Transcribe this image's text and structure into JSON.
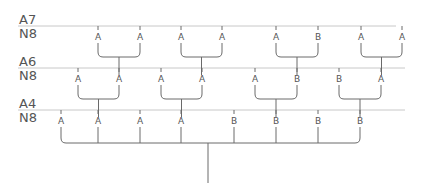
{
  "diagram": {
    "levels": [
      {
        "top_label": "A7",
        "bottom_label": "N8",
        "line_y": 26,
        "line_x1": 18,
        "line_x2": 396
      },
      {
        "top_label": "A6",
        "bottom_label": "N8",
        "line_y": 68,
        "line_x1": 18,
        "line_x2": 405
      },
      {
        "top_label": "A4",
        "bottom_label": "N8",
        "line_y": 110,
        "line_x1": 18,
        "line_x2": 405
      }
    ],
    "rows": [
      {
        "label_y": 37,
        "nodes": [
          {
            "x": 98,
            "label": "A"
          },
          {
            "x": 140,
            "label": "A"
          },
          {
            "x": 181,
            "label": "A"
          },
          {
            "x": 222,
            "label": "A"
          },
          {
            "x": 276,
            "label": "A"
          },
          {
            "x": 318,
            "label": "B"
          },
          {
            "x": 361,
            "label": "A"
          },
          {
            "x": 402,
            "label": "A"
          }
        ],
        "join_y": 57,
        "stem_bottom_y": 68
      },
      {
        "label_y": 79,
        "nodes": [
          {
            "x": 78,
            "label": "A"
          },
          {
            "x": 119,
            "label": "A"
          },
          {
            "x": 161,
            "label": "A"
          },
          {
            "x": 202,
            "label": "A"
          },
          {
            "x": 255,
            "label": "A"
          },
          {
            "x": 297,
            "label": "B"
          },
          {
            "x": 339,
            "label": "B"
          },
          {
            "x": 381,
            "label": "A"
          }
        ],
        "join_y": 99,
        "stem_bottom_y": 110
      },
      {
        "label_y": 121,
        "nodes": [
          {
            "x": 61,
            "label": "A"
          },
          {
            "x": 98,
            "label": "A"
          },
          {
            "x": 140,
            "label": "A"
          },
          {
            "x": 181,
            "label": "A"
          },
          {
            "x": 234,
            "label": "B"
          },
          {
            "x": 276,
            "label": "B"
          },
          {
            "x": 318,
            "label": "B"
          },
          {
            "x": 360,
            "label": "B"
          }
        ],
        "join_y": 143,
        "root_x": 208,
        "root_bottom_y": 183
      }
    ],
    "colors": {
      "line": "#6a6a6a",
      "level_line": "#c8c8c8",
      "text": "#555555"
    }
  }
}
